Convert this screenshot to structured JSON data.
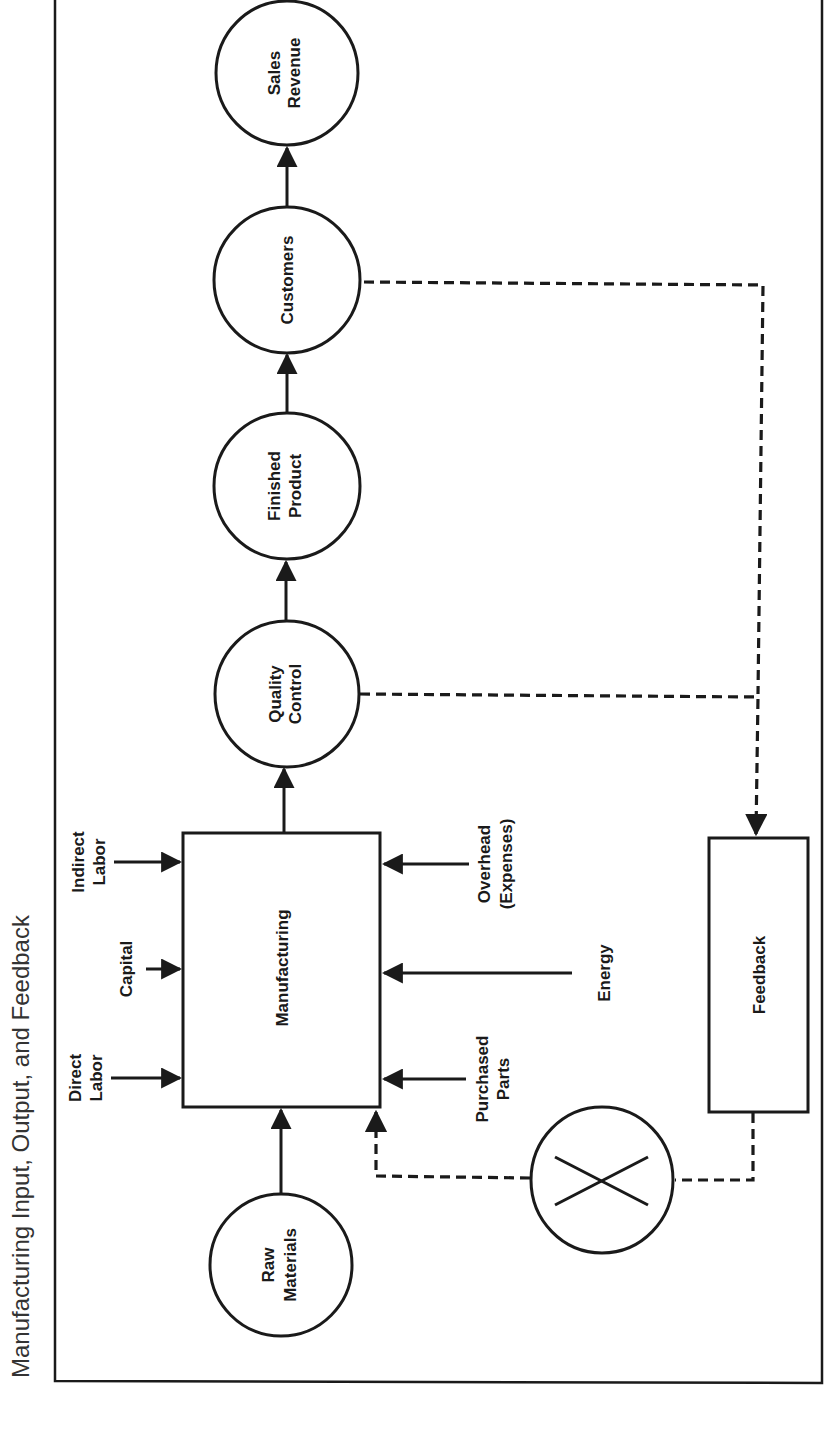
{
  "title": "Manufacturing Input, Output, and Feedback",
  "colors": {
    "ink": "#1a1a1a",
    "background": "#ffffff",
    "title": "#333333"
  },
  "nodes": {
    "raw_materials": {
      "shape": "circle",
      "lines": [
        "Raw",
        "Materials"
      ]
    },
    "manufacturing": {
      "shape": "rectangle",
      "lines": [
        "Manufacturing"
      ]
    },
    "quality_control": {
      "shape": "circle",
      "lines": [
        "Quality",
        "Control"
      ]
    },
    "finished_product": {
      "shape": "circle",
      "lines": [
        "Finished",
        "Product"
      ]
    },
    "customers": {
      "shape": "circle",
      "lines": [
        "Customers"
      ]
    },
    "sales_revenue": {
      "shape": "circle",
      "lines": [
        "Sales",
        "Revenue"
      ]
    },
    "feedback": {
      "shape": "rectangle",
      "lines": [
        "Feedback"
      ]
    },
    "comparator": {
      "shape": "circle-with-x",
      "lines": []
    }
  },
  "inputs": {
    "direct_labor": [
      "Direct",
      "Labor"
    ],
    "capital": [
      "Capital"
    ],
    "indirect_labor": [
      "Indirect",
      "Labor"
    ],
    "purchased_parts": [
      "Purchased",
      "Parts"
    ],
    "energy": [
      "Energy"
    ],
    "overhead": [
      "Overhead",
      "(Expenses)"
    ]
  },
  "edges": [
    {
      "from": "Raw Materials",
      "to": "Manufacturing",
      "style": "solid"
    },
    {
      "from": "Direct Labor",
      "to": "Manufacturing",
      "style": "solid"
    },
    {
      "from": "Capital",
      "to": "Manufacturing",
      "style": "solid"
    },
    {
      "from": "Indirect Labor",
      "to": "Manufacturing",
      "style": "solid"
    },
    {
      "from": "Purchased Parts",
      "to": "Manufacturing",
      "style": "solid"
    },
    {
      "from": "Energy",
      "to": "Manufacturing",
      "style": "solid"
    },
    {
      "from": "Overhead (Expenses)",
      "to": "Manufacturing",
      "style": "solid"
    },
    {
      "from": "Manufacturing",
      "to": "Quality Control",
      "style": "solid"
    },
    {
      "from": "Quality Control",
      "to": "Finished Product",
      "style": "solid"
    },
    {
      "from": "Finished Product",
      "to": "Customers",
      "style": "solid"
    },
    {
      "from": "Customers",
      "to": "Sales Revenue",
      "style": "solid"
    },
    {
      "from": "Customers",
      "to": "Feedback",
      "style": "dashed"
    },
    {
      "from": "Quality Control",
      "to": "Feedback",
      "style": "dashed"
    },
    {
      "from": "Feedback",
      "to": "Comparator",
      "style": "dashed"
    },
    {
      "from": "Comparator",
      "to": "Manufacturing",
      "style": "dashed"
    }
  ]
}
